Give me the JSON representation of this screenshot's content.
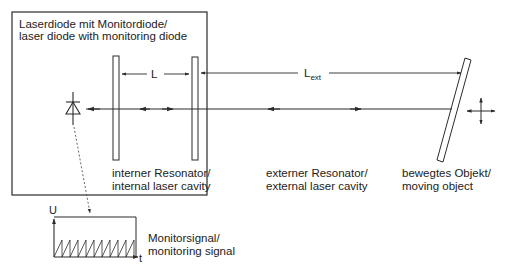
{
  "diagram": {
    "laser_box": {
      "label_line1": "Laserdiode mit Monitordiode/",
      "label_line2": "laser diode with monitoring diode"
    },
    "internal_cavity": {
      "length_label": "L",
      "label_line1": "interner Resonator/",
      "label_line2": "internal laser cavity"
    },
    "external_cavity": {
      "length_label": "L",
      "length_subscript": "ext",
      "label_line1": "externer Resonator/",
      "label_line2": "external laser cavity"
    },
    "moving_object": {
      "label_line1": "bewegtes Objekt/",
      "label_line2": "moving object"
    },
    "monitor_signal": {
      "y_axis_label": "U",
      "x_axis_label": "t",
      "label_line1": "Monitorsignal/",
      "label_line2": "monitoring signal",
      "sawtooth_teeth": 10
    },
    "colors": {
      "line": "#2b2b2b",
      "text": "#222222",
      "background": "#ffffff"
    }
  }
}
